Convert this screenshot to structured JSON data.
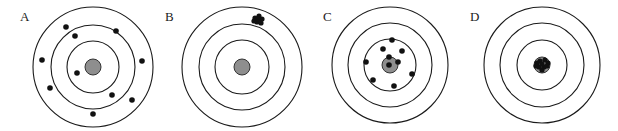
{
  "figure": {
    "colors": {
      "ring": "#1a1a1a",
      "bullseye": "#8e8e8e",
      "shot": "#111111",
      "background": "#ffffff"
    },
    "targets": [
      {
        "label": "A",
        "label_pos": [
          20,
          21
        ],
        "center": [
          93,
          67
        ],
        "rings": [
          60,
          42,
          26
        ],
        "bullseye_r": 8,
        "shots": [
          [
            66,
            27
          ],
          [
            116,
            31
          ],
          [
            75,
            36
          ],
          [
            42,
            60
          ],
          [
            142,
            61
          ],
          [
            77,
            73
          ],
          [
            50,
            88
          ],
          [
            112,
            95
          ],
          [
            132,
            100
          ],
          [
            93,
            114
          ]
        ],
        "shot_r": 2.8
      },
      {
        "label": "B",
        "label_pos": [
          165,
          21
        ],
        "center": [
          242,
          67
        ],
        "rings": [
          60,
          43,
          27
        ],
        "bullseye_r": 8,
        "shots": [
          [
            255,
            18
          ],
          [
            259,
            16
          ],
          [
            262,
            19
          ],
          [
            257,
            22
          ],
          [
            261,
            23
          ],
          [
            254,
            21
          ],
          [
            258,
            19
          ]
        ],
        "shot_r": 2.6
      },
      {
        "label": "C",
        "label_pos": [
          323,
          21
        ],
        "center": [
          390,
          65
        ],
        "rings": [
          58,
          42,
          26
        ],
        "bullseye_r": 8,
        "shots": [
          [
            392,
            40
          ],
          [
            383,
            49
          ],
          [
            402,
            51
          ],
          [
            366,
            62
          ],
          [
            389,
            57
          ],
          [
            398,
            62
          ],
          [
            389,
            65
          ],
          [
            412,
            74
          ],
          [
            373,
            80
          ],
          [
            394,
            86
          ]
        ],
        "shot_r": 2.8
      },
      {
        "label": "D",
        "label_pos": [
          470,
          21
        ],
        "center": [
          542,
          65
        ],
        "rings": [
          58,
          42,
          25
        ],
        "bullseye_r": 8,
        "shots": [
          [
            537,
            63
          ],
          [
            540,
            61
          ],
          [
            545,
            60
          ],
          [
            548,
            63
          ],
          [
            544,
            67
          ],
          [
            539,
            67
          ],
          [
            542,
            70
          ],
          [
            536,
            66
          ],
          [
            547,
            66
          ],
          [
            542,
            64
          ]
        ],
        "shot_r": 2.6
      }
    ]
  }
}
